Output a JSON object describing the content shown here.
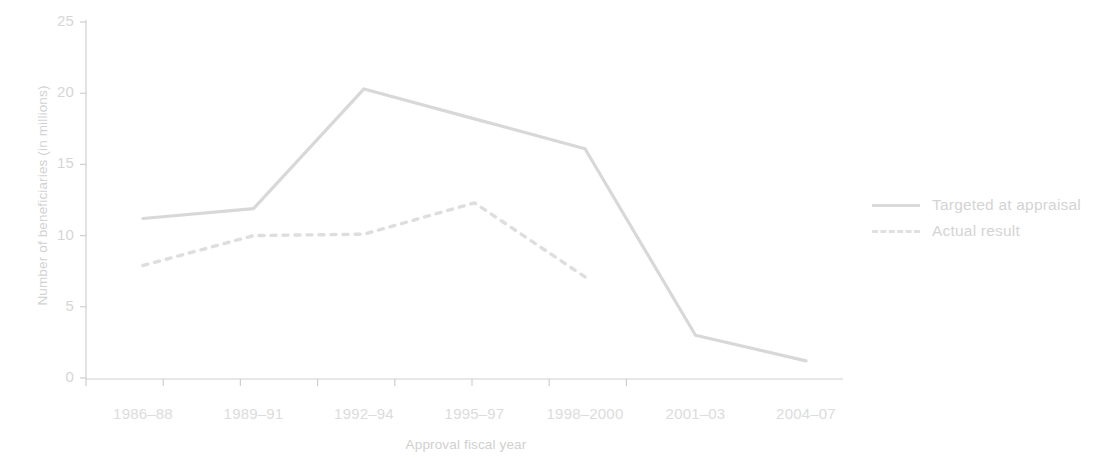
{
  "chart_data": {
    "type": "line",
    "title": "",
    "xlabel": "Approval fiscal year",
    "ylabel": "Number of beneficiaries (in millions)",
    "categories": [
      "1986–88",
      "1989–91",
      "1992–94",
      "1995–97",
      "1998–2000",
      "2001–03",
      "2004–07"
    ],
    "ylim": [
      0,
      25
    ],
    "yticks": [
      0,
      5,
      10,
      15,
      20,
      25
    ],
    "ytick_labels": [
      "0",
      "5",
      "10",
      "15",
      "20",
      "25"
    ],
    "grid": false,
    "legend_position": "right",
    "series": [
      {
        "name": "Targeted at appraisal",
        "style": "solid",
        "color": "#d8d8d8",
        "values": [
          11.2,
          11.9,
          20.3,
          18.2,
          16.1,
          3.0,
          1.2
        ]
      },
      {
        "name": "Actual result",
        "style": "dashed",
        "color": "#dedede",
        "values": [
          7.9,
          10.0,
          10.1,
          12.3,
          7.1,
          null,
          null
        ]
      }
    ]
  },
  "axis": {
    "y_title": "Number of beneficiaries (in millions)",
    "x_title": "Approval fiscal year"
  },
  "legend": {
    "items": [
      {
        "label": "Targeted at appraisal",
        "style": "solid"
      },
      {
        "label": "Actual result",
        "style": "dashed"
      }
    ]
  }
}
